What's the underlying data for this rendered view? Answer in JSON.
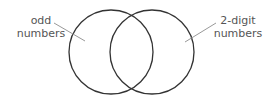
{
  "diagram": {
    "type": "venn",
    "sets": [
      {
        "label_line1": "odd",
        "label_line2": "numbers"
      },
      {
        "label_line1": "2-digit",
        "label_line2": "numbers"
      }
    ],
    "colors": {
      "circle_stroke": "#333333",
      "leader_line": "#999999",
      "text": "#555555"
    }
  }
}
